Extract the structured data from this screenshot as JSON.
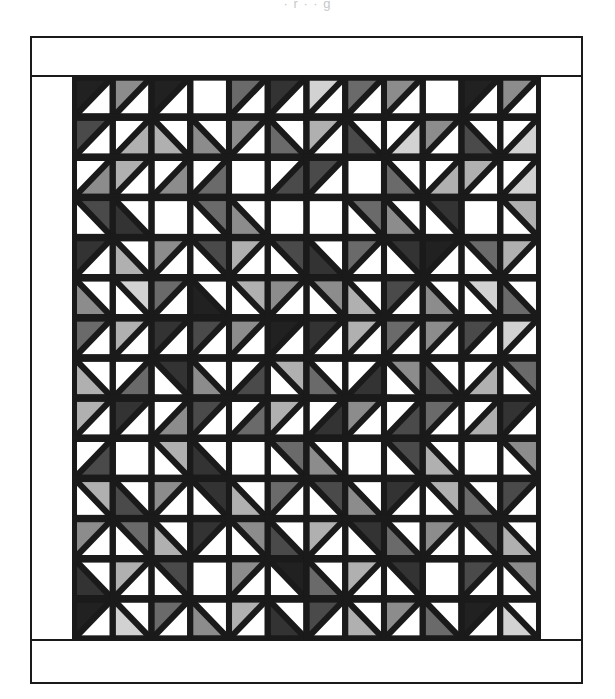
{
  "figure": {
    "kind": "quilt-block-layout-diagram",
    "caption_partial": "· r · · g",
    "title": "",
    "palette": {
      "white": "#ffffff",
      "light_gray": "#d2d2d2",
      "mid_light_gray": "#b0b0b0",
      "mid_gray": "#8c8c8c",
      "mid_dark_gray": "#6a6a6a",
      "dark_gray": "#4a4a4a",
      "charcoal": "#333333",
      "near_black": "#212121",
      "outline": "#1a1a1a"
    },
    "frame": {
      "label": "quilt-border",
      "border_color": "#1a1a1a",
      "border_width_px": 2.5,
      "sash_top_label": "top-border-strip",
      "sash_bottom_label": "bottom-border-strip",
      "sash_left_label": "left-border-strip",
      "sash_right_label": "right-border-strip"
    },
    "grid": {
      "columns": 12,
      "rows": 14,
      "unit": "half-square-triangle",
      "cell_width_px": 42.3,
      "cell_height_px": 40.2
    }
  },
  "chart_data": {
    "type": "heatmap",
    "xlabel": "",
    "ylabel": "",
    "legend": [],
    "grid": true,
    "ncols": 12,
    "nrows": 14,
    "shade_key": {
      "0": "#ffffff",
      "1": "#d2d2d2",
      "2": "#b0b0b0",
      "3": "#8c8c8c",
      "4": "#6a6a6a",
      "5": "#4a4a4a",
      "6": "#333333",
      "7": "#212121"
    },
    "orientation_key": {
      "tl": "triangle fills top-left half (diagonal from bottom-left to top-right)",
      "tr": "triangle fills top-right half (diagonal from top-left to bottom-right)",
      "bl": "triangle fills bottom-left half (diagonal from top-left to bottom-right)",
      "br": "triangle fills bottom-right half (diagonal from bottom-left to top-right)",
      "none": "plain square, no triangle"
    },
    "cells": [
      [
        [
          "tl",
          7
        ],
        [
          "tl",
          3
        ],
        [
          "tl",
          7
        ],
        [
          "none",
          0
        ],
        [
          "tl",
          4
        ],
        [
          "tl",
          6
        ],
        [
          "tl",
          1
        ],
        [
          "tl",
          4
        ],
        [
          "tl",
          3
        ],
        [
          "none",
          0
        ],
        [
          "tl",
          7
        ],
        [
          "tl",
          3
        ]
      ],
      [
        [
          "tl",
          5
        ],
        [
          "br",
          2
        ],
        [
          "bl",
          2
        ],
        [
          "bl",
          3
        ],
        [
          "tl",
          3
        ],
        [
          "bl",
          4
        ],
        [
          "tl",
          2
        ],
        [
          "bl",
          5
        ],
        [
          "br",
          1
        ],
        [
          "tl",
          3
        ],
        [
          "bl",
          5
        ],
        [
          "br",
          1
        ]
      ],
      [
        [
          "br",
          3
        ],
        [
          "tl",
          2
        ],
        [
          "br",
          3
        ],
        [
          "br",
          4
        ],
        [
          "none",
          0
        ],
        [
          "br",
          5
        ],
        [
          "tl",
          5
        ],
        [
          "none",
          0
        ],
        [
          "bl",
          4
        ],
        [
          "br",
          2
        ],
        [
          "tl",
          2
        ],
        [
          "br",
          1
        ]
      ],
      [
        [
          "tr",
          5
        ],
        [
          "bl",
          6
        ],
        [
          "none",
          0
        ],
        [
          "tr",
          4
        ],
        [
          "bl",
          3
        ],
        [
          "none",
          0
        ],
        [
          "none",
          0
        ],
        [
          "tr",
          4
        ],
        [
          "bl",
          3
        ],
        [
          "tr",
          6
        ],
        [
          "none",
          0
        ],
        [
          "tr",
          2
        ]
      ],
      [
        [
          "tl",
          6
        ],
        [
          "bl",
          2
        ],
        [
          "tl",
          3
        ],
        [
          "tr",
          5
        ],
        [
          "tl",
          2
        ],
        [
          "tr",
          5
        ],
        [
          "bl",
          6
        ],
        [
          "tl",
          4
        ],
        [
          "tr",
          6
        ],
        [
          "tl",
          7
        ],
        [
          "tr",
          4
        ],
        [
          "tl",
          2
        ]
      ],
      [
        [
          "bl",
          3
        ],
        [
          "tr",
          1
        ],
        [
          "tl",
          4
        ],
        [
          "bl",
          7
        ],
        [
          "tr",
          2
        ],
        [
          "tl",
          3
        ],
        [
          "tr",
          3
        ],
        [
          "bl",
          2
        ],
        [
          "tl",
          5
        ],
        [
          "bl",
          3
        ],
        [
          "tr",
          1
        ],
        [
          "bl",
          4
        ]
      ],
      [
        [
          "tl",
          4
        ],
        [
          "tl",
          2
        ],
        [
          "tl",
          6
        ],
        [
          "tl",
          5
        ],
        [
          "tl",
          3
        ],
        [
          "tl",
          7
        ],
        [
          "tl",
          6
        ],
        [
          "tl",
          2
        ],
        [
          "tl",
          4
        ],
        [
          "tl",
          3
        ],
        [
          "tl",
          5
        ],
        [
          "tl",
          1
        ]
      ],
      [
        [
          "bl",
          2
        ],
        [
          "br",
          4
        ],
        [
          "tr",
          6
        ],
        [
          "bl",
          3
        ],
        [
          "br",
          5
        ],
        [
          "tr",
          2
        ],
        [
          "bl",
          4
        ],
        [
          "br",
          6
        ],
        [
          "tr",
          3
        ],
        [
          "bl",
          5
        ],
        [
          "br",
          2
        ],
        [
          "tr",
          4
        ]
      ],
      [
        [
          "tl",
          2
        ],
        [
          "tl",
          6
        ],
        [
          "br",
          3
        ],
        [
          "tl",
          5
        ],
        [
          "br",
          4
        ],
        [
          "tl",
          2
        ],
        [
          "br",
          6
        ],
        [
          "tl",
          3
        ],
        [
          "br",
          5
        ],
        [
          "tl",
          4
        ],
        [
          "br",
          2
        ],
        [
          "tl",
          6
        ]
      ],
      [
        [
          "br",
          5
        ],
        [
          "none",
          0
        ],
        [
          "tr",
          2
        ],
        [
          "bl",
          6
        ],
        [
          "none",
          0
        ],
        [
          "tr",
          4
        ],
        [
          "bl",
          3
        ],
        [
          "none",
          0
        ],
        [
          "tr",
          5
        ],
        [
          "bl",
          2
        ],
        [
          "none",
          0
        ],
        [
          "tr",
          3
        ]
      ],
      [
        [
          "tr",
          2
        ],
        [
          "bl",
          5
        ],
        [
          "tl",
          3
        ],
        [
          "tr",
          6
        ],
        [
          "bl",
          2
        ],
        [
          "tl",
          4
        ],
        [
          "tr",
          5
        ],
        [
          "bl",
          3
        ],
        [
          "tl",
          6
        ],
        [
          "tr",
          2
        ],
        [
          "bl",
          4
        ],
        [
          "tl",
          5
        ]
      ],
      [
        [
          "tl",
          3
        ],
        [
          "tr",
          4
        ],
        [
          "bl",
          2
        ],
        [
          "tl",
          6
        ],
        [
          "tr",
          3
        ],
        [
          "bl",
          5
        ],
        [
          "tl",
          2
        ],
        [
          "tr",
          6
        ],
        [
          "bl",
          4
        ],
        [
          "tl",
          3
        ],
        [
          "tr",
          5
        ],
        [
          "bl",
          2
        ]
      ],
      [
        [
          "bl",
          6
        ],
        [
          "tl",
          2
        ],
        [
          "tr",
          5
        ],
        [
          "none",
          0
        ],
        [
          "tl",
          3
        ],
        [
          "tr",
          7
        ],
        [
          "bl",
          4
        ],
        [
          "tl",
          2
        ],
        [
          "tr",
          6
        ],
        [
          "none",
          0
        ],
        [
          "tl",
          5
        ],
        [
          "tr",
          3
        ]
      ],
      [
        [
          "tl",
          7
        ],
        [
          "bl",
          1
        ],
        [
          "tl",
          4
        ],
        [
          "bl",
          3
        ],
        [
          "tl",
          2
        ],
        [
          "bl",
          6
        ],
        [
          "tl",
          5
        ],
        [
          "bl",
          2
        ],
        [
          "tl",
          3
        ],
        [
          "bl",
          4
        ],
        [
          "tl",
          7
        ],
        [
          "bl",
          1
        ]
      ]
    ]
  }
}
